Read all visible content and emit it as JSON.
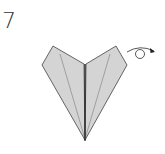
{
  "step": {
    "number": "7"
  },
  "diagram": {
    "paper_color": "#d4d4d4",
    "outline_color": "#555555",
    "crease_color": "#888888",
    "center_line_color": "#222222",
    "action_symbol": "turn-over-arrow"
  }
}
